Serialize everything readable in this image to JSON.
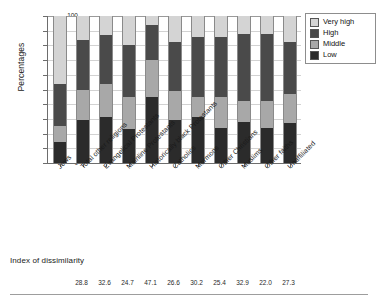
{
  "chart_data": {
    "type": "bar",
    "subtype": "stacked-bar-100",
    "title": "",
    "xlabel": "",
    "ylabel": "Percentages",
    "ylim": [
      0,
      100
    ],
    "ytick_step": 10,
    "yticks": [
      "100",
      "90",
      "80",
      "70",
      "60",
      "50",
      "40",
      "30",
      "20",
      "10",
      "0"
    ],
    "grid": true,
    "legend_position": "right",
    "categories": [
      "Jews",
      "Total other religions",
      "Evangelical Protestants",
      "Mainline Protestants",
      "Historically black Protestants",
      "Catholics",
      "Mormons",
      "Other Christians",
      "Muslims",
      "Other faiths",
      "Unaffiliated"
    ],
    "series": [
      {
        "name": "Low",
        "color": "#2b2b2b",
        "values": [
          14,
          29,
          31,
          23,
          45,
          29,
          31,
          24,
          28,
          24,
          27
        ]
      },
      {
        "name": "Middle",
        "color": "#a8a8a8",
        "values": [
          11,
          21,
          23,
          22,
          25,
          20,
          14,
          21,
          14,
          18,
          20
        ]
      },
      {
        "name": "High",
        "color": "#4a4a4a",
        "values": [
          29,
          34,
          33,
          35,
          24,
          33,
          41,
          41,
          46,
          46,
          35
        ]
      },
      {
        "name": "Very high",
        "color": "#d4d4d4",
        "values": [
          46,
          16,
          13,
          20,
          6,
          18,
          14,
          14,
          12,
          12,
          18
        ]
      }
    ],
    "legend_order": [
      "Very high",
      "High",
      "Middle",
      "Low"
    ]
  },
  "legend": {
    "items": [
      {
        "label": "Very high",
        "color": "#d4d4d4"
      },
      {
        "label": "High",
        "color": "#4a4a4a"
      },
      {
        "label": "Middle",
        "color": "#a8a8a8"
      },
      {
        "label": "Low",
        "color": "#2b2b2b"
      }
    ]
  },
  "index_panel": {
    "title": "Index of dissimilarity",
    "values": [
      "28.8",
      "32.6",
      "24.7",
      "47.1",
      "26.6",
      "30.2",
      "25.4",
      "32.9",
      "22.0",
      "27.3"
    ]
  }
}
